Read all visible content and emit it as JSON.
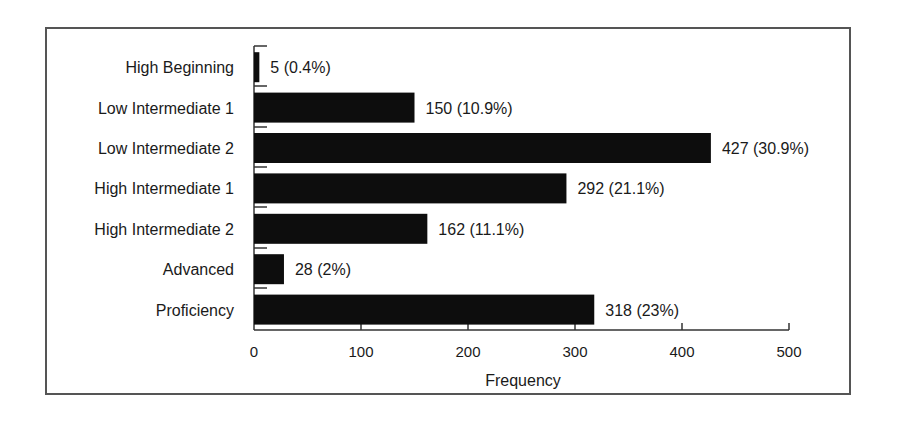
{
  "chart_data": {
    "type": "bar",
    "orientation": "horizontal",
    "title": "",
    "xlabel": "Frequency",
    "ylabel": "",
    "xlim": [
      0,
      500
    ],
    "xticks": [
      0,
      100,
      200,
      300,
      400,
      500
    ],
    "grid": false,
    "legend": null,
    "categories": [
      "High Beginning",
      "Low Intermediate 1",
      "Low Intermediate 2",
      "High Intermediate 1",
      "High Intermediate 2",
      "Advanced",
      "Proficiency"
    ],
    "values": [
      5,
      150,
      427,
      292,
      162,
      28,
      318
    ],
    "percentages": [
      "0.4%",
      "10.9%",
      "30.9%",
      "21.1%",
      "11.1%",
      "2%",
      "23%"
    ],
    "data_labels": [
      "5 (0.4%)",
      "150 (10.9%)",
      "427 (30.9%)",
      "292 (21.1%)",
      "162 (11.1%)",
      "28 (2%)",
      "318 (23%)"
    ],
    "bar_color": "#0d0d0d"
  },
  "axis": {
    "xlabel": "Frequency",
    "ticks": [
      "0",
      "100",
      "200",
      "300",
      "400",
      "500"
    ]
  },
  "bars": [
    {
      "category": "High Beginning",
      "label": "5 (0.4%)"
    },
    {
      "category": "Low Intermediate 1",
      "label": "150 (10.9%)"
    },
    {
      "category": "Low Intermediate 2",
      "label": "427 (30.9%)"
    },
    {
      "category": "High Intermediate 1",
      "label": "292 (21.1%)"
    },
    {
      "category": "High Intermediate 2",
      "label": "162 (11.1%)"
    },
    {
      "category": "Advanced",
      "label": "28 (2%)"
    },
    {
      "category": "Proficiency",
      "label": "318 (23%)"
    }
  ]
}
